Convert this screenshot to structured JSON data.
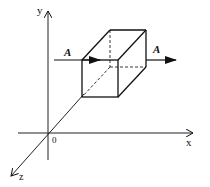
{
  "diagram": {
    "axes": {
      "y_label": "y",
      "x_label": "x",
      "z_label": "z",
      "origin_label": "0"
    },
    "vectors": [
      {
        "label": "A",
        "side": "left"
      },
      {
        "label": "A",
        "side": "right"
      }
    ],
    "shape": "rectangular box (cube) with hidden edges dashed",
    "colors": {
      "stroke": "#111111",
      "background": "#ffffff"
    }
  }
}
